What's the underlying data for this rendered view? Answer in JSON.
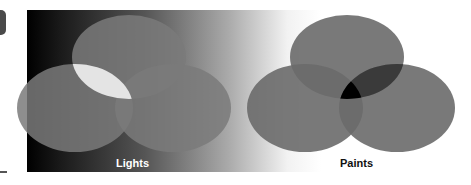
{
  "diagram": {
    "left": {
      "label": "Lights",
      "label_color": "#ffffff",
      "circle_fill": "#7a7a7a",
      "intersection_fill": "#e8e8e8"
    },
    "right": {
      "label": "Paints",
      "label_color": "#111111",
      "circle_fill": "#6e6e6e",
      "intersection_fill": "#000000"
    }
  }
}
